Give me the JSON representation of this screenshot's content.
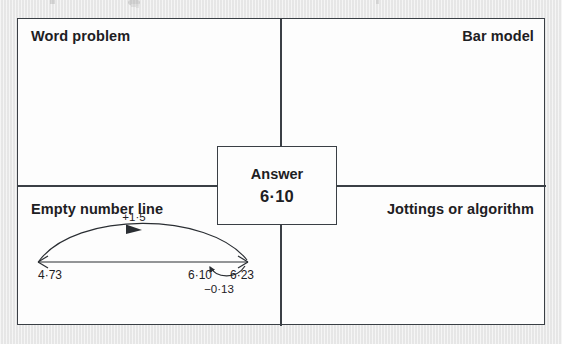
{
  "worksheet": {
    "quadrants": [
      {
        "id": "word-problem",
        "label": "Word problem",
        "align": "left"
      },
      {
        "id": "bar-model",
        "label": "Bar model",
        "align": "right"
      },
      {
        "id": "empty-number-line",
        "label": "Empty number line",
        "align": "left"
      },
      {
        "id": "jottings",
        "label": "Jottings or algorithm",
        "align": "right"
      }
    ],
    "answer": {
      "label": "Answer",
      "value": "6·10"
    },
    "number_line": {
      "start_label": "4·73",
      "end_label": "6·23",
      "result_label": "6·10",
      "forward_jump_label": "+1·5",
      "back_jump_label": "−0·13"
    }
  },
  "colors": {
    "page_background": "#e9e9e9",
    "card_background": "#fdfdfd",
    "ink": "#1d2023",
    "rule": "#3a3f45"
  }
}
